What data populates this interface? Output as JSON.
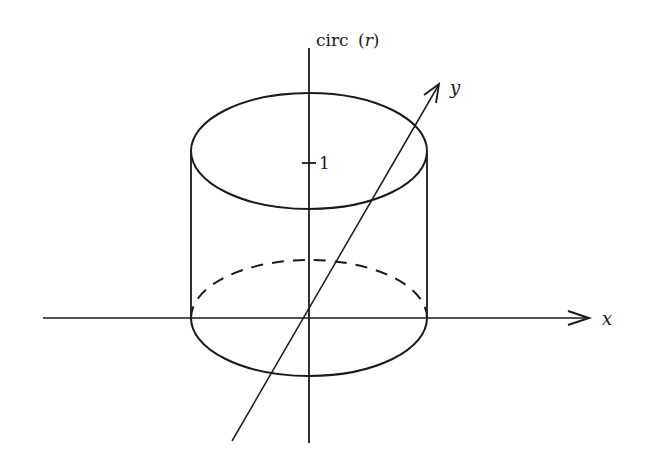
{
  "diagram": {
    "labels": {
      "vertical_axis": "circ",
      "vertical_axis_arg_open": "(",
      "vertical_axis_arg": "r",
      "vertical_axis_arg_close": ")",
      "x_axis": "x",
      "y_axis": "y",
      "tick_value": "1"
    },
    "colors": {
      "stroke": "#1a1a1a",
      "background": "#ffffff"
    }
  }
}
